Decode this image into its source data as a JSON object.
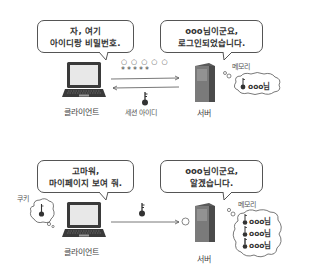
{
  "top_panel": {
    "client_bubble": {
      "line1": "자, 여기",
      "line2": "아이디랑 비밀번호."
    },
    "server_bubble": {
      "line1": "ooo님이군요,",
      "line2": "로그인되었습니다."
    },
    "credentials": {
      "id_dots": "○○○○○",
      "password_stars": "*****"
    },
    "session_id_label": "세션 아이디",
    "client_label": "클라이언트",
    "server_label": "서버",
    "memory_label": "메모리",
    "memory_entries": [
      {
        "text": "ooo님"
      }
    ]
  },
  "bottom_panel": {
    "client_bubble": {
      "line1": "고마워,",
      "line2": "마이페이지 보여 줘."
    },
    "server_bubble": {
      "line1": "ooo님이군요,",
      "line2": "알겠습니다."
    },
    "cookie_label": "쿠키",
    "client_label": "클라이언트",
    "server_label": "서버",
    "memory_label": "메모리",
    "memory_entries": [
      {
        "text": "ooo님"
      },
      {
        "text": "ooo님"
      },
      {
        "text": "ooo님"
      }
    ]
  },
  "colors": {
    "line": "#555555",
    "device_dark": "#3a3a3a",
    "server_gray": "#6b6b6b",
    "screen": "#e8e8e8"
  }
}
